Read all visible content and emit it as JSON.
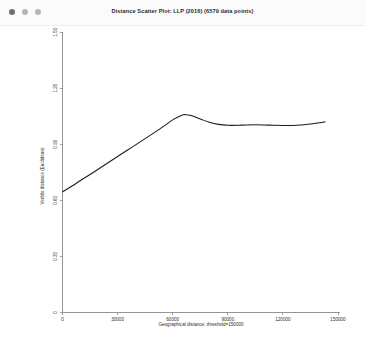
{
  "window": {
    "title": "Distance Scatter Plot: LLP (2016) (6579 data points)",
    "traffic_lights": [
      {
        "name": "close",
        "color": "#6f6f6f"
      },
      {
        "name": "minimize",
        "color": "#b5b5b5"
      },
      {
        "name": "zoom",
        "color": "#b5b5b5"
      }
    ],
    "titlebar_bg": "#fbfbfb",
    "canvas_bg": "#ffffff"
  },
  "chart_data": {
    "type": "line",
    "title": "Distance Scatter Plot: LLP (2016) (6579 data points)",
    "xlabel": "Geographical distance: threshold=150000",
    "ylabel": "Verbile distance (Euclidean)",
    "xlim": [
      0,
      150000
    ],
    "ylim": [
      0,
      1.5
    ],
    "xticks": [
      0,
      30000,
      60000,
      90000,
      120000,
      150000
    ],
    "xticklabels": [
      "0",
      "30000",
      "60000",
      "90000",
      "120000",
      "150000"
    ],
    "yticks": [
      0,
      0.3,
      0.6,
      0.9,
      1.2,
      1.5
    ],
    "yticklabels": [
      "0",
      "0.30",
      "0.60",
      "0.90",
      "1.20",
      "1.50"
    ],
    "grid": false,
    "legend": null,
    "line_color": "#1a1a1a",
    "axis_color": "#8a8a8a",
    "n_points": 6579,
    "series": [
      {
        "name": "smoothed trend",
        "x": [
          0,
          5000,
          10000,
          15000,
          20000,
          25000,
          30000,
          35000,
          40000,
          45000,
          50000,
          55000,
          60000,
          65000,
          67000,
          70000,
          75000,
          80000,
          85000,
          90000,
          95000,
          100000,
          105000,
          110000,
          115000,
          120000,
          125000,
          130000,
          135000,
          140000,
          143000
        ],
        "y": [
          0.645,
          0.675,
          0.707,
          0.738,
          0.77,
          0.802,
          0.834,
          0.866,
          0.898,
          0.93,
          0.962,
          0.995,
          1.03,
          1.055,
          1.058,
          1.053,
          1.035,
          1.017,
          1.006,
          1.001,
          1.001,
          1.003,
          1.004,
          1.003,
          1.001,
          1.0,
          1.0,
          1.003,
          1.008,
          1.015,
          1.02
        ]
      }
    ]
  }
}
